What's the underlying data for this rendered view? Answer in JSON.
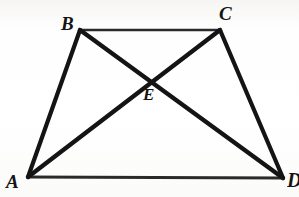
{
  "figure": {
    "type": "geometry-diagram",
    "background_color": "#fdfdfc",
    "stroke_color": "#141414",
    "clipped_header_text": "",
    "points": {
      "A": {
        "label": "A",
        "x": 28,
        "y": 177
      },
      "B": {
        "label": "B",
        "x": 80,
        "y": 30
      },
      "C": {
        "label": "C",
        "x": 220,
        "y": 30
      },
      "D": {
        "label": "D",
        "x": 283,
        "y": 178
      },
      "E": {
        "label": "E",
        "x": 152,
        "y": 77
      }
    },
    "segments": [
      {
        "name": "side-AB",
        "from": "A",
        "to": "B",
        "width": 4.2
      },
      {
        "name": "side-BC",
        "from": "B",
        "to": "C",
        "width": 2.6
      },
      {
        "name": "side-CD",
        "from": "C",
        "to": "D",
        "width": 4.2
      },
      {
        "name": "side-AD",
        "from": "A",
        "to": "D",
        "width": 2.8
      },
      {
        "name": "diagonal-AC",
        "from": "A",
        "to": "C",
        "width": 4.4
      },
      {
        "name": "diagonal-BD",
        "from": "B",
        "to": "D",
        "width": 4.4
      }
    ],
    "labels": {
      "A": "A",
      "B": "B",
      "C": "C",
      "D": "D",
      "E": "E"
    }
  }
}
